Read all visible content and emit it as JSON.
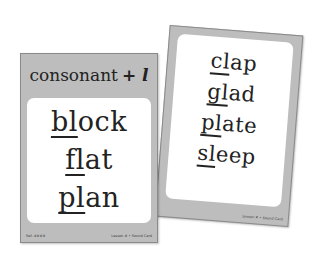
{
  "scene": {
    "background": "#ffffff",
    "card_color": "#bdbdbd",
    "panel_color": "#ffffff"
  },
  "right_card": {
    "words": [
      {
        "blend": "cl",
        "rest": "ap"
      },
      {
        "blend": "gl",
        "rest": "ad"
      },
      {
        "blend": "pl",
        "rest": "ate"
      },
      {
        "blend": "sl",
        "rest": "eep"
      }
    ],
    "footer_right": "Lesson # • Sound Card"
  },
  "left_card": {
    "header": {
      "title": "consonant",
      "suffix": "+ l"
    },
    "words": [
      {
        "blend": "bl",
        "rest": "ock"
      },
      {
        "blend": "fl",
        "rest": "at"
      },
      {
        "blend": "pl",
        "rest": "an"
      }
    ],
    "footer_left": "Ref. ####",
    "footer_right": "Lesson # • Sound Card"
  }
}
